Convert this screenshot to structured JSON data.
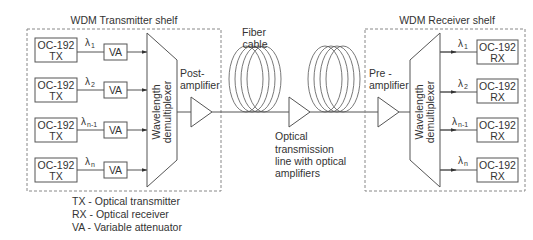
{
  "transmitter_shelf": {
    "title": "WDM Transmitter shelf",
    "channels": [
      {
        "tx_line1": "OC-192",
        "tx_line2": "TX",
        "lambda": "λ",
        "sub": "1",
        "va": "VA"
      },
      {
        "tx_line1": "OC-192",
        "tx_line2": "TX",
        "lambda": "λ",
        "sub": "2",
        "va": "VA"
      },
      {
        "tx_line1": "OC-192",
        "tx_line2": "TX",
        "lambda": "λ",
        "sub": "n-1",
        "va": "VA"
      },
      {
        "tx_line1": "OC-192",
        "tx_line2": "TX",
        "lambda": "λ",
        "sub": "n",
        "va": "VA"
      }
    ],
    "mux_label_line1": "Wavelength",
    "mux_label_line2": "demultiplexer"
  },
  "post_amplifier": {
    "line1": "Post-",
    "line2": "amplifier"
  },
  "fiber": {
    "line1": "Fiber",
    "line2": "cable"
  },
  "transmission_line": {
    "line1": "Optical",
    "line2": "transmission",
    "line3": "line with optical",
    "line4": "amplifiers"
  },
  "pre_amplifier": {
    "line1": "Pre -",
    "line2": "amplifier"
  },
  "receiver_shelf": {
    "title": "WDM Receiver shelf",
    "channels": [
      {
        "rx_line1": "OC-192",
        "rx_line2": "RX",
        "lambda": "λ",
        "sub": "1"
      },
      {
        "rx_line1": "OC-192",
        "rx_line2": "RX",
        "lambda": "λ",
        "sub": "2"
      },
      {
        "rx_line1": "OC-192",
        "rx_line2": "RX",
        "lambda": "λ",
        "sub": "n-1"
      },
      {
        "rx_line1": "OC-192",
        "rx_line2": "RX",
        "lambda": "λ",
        "sub": "n"
      }
    ],
    "demux_label_line1": "Wavelength",
    "demux_label_line2": "demultiplexer"
  },
  "legend": [
    "TX - Optical transmitter",
    "RX - Optical receiver",
    "VA - Variable attenuator"
  ],
  "colors": {
    "stroke": "#555555",
    "text": "#333333",
    "dashed": "#888888"
  }
}
